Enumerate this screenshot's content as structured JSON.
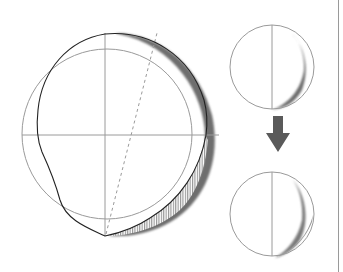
{
  "diagram": {
    "title": "",
    "colors": {
      "outline": "#9a9a9a",
      "profile": "#222222",
      "shadow": "#6e6e6e",
      "hatch": "#8a8a8a",
      "arrow": "#5a5a5a",
      "background": "#ffffff"
    },
    "main_figure": {
      "shape": "reference-circle-with-deformed-profile",
      "axes": [
        "vertical-axis",
        "horizontal-axis"
      ],
      "dashed_line": "tilted-axis",
      "regions": [
        "shadow-crescent",
        "hatched-crescent"
      ]
    },
    "side_panel": {
      "before": "circle-with-thin-shadow",
      "arrow": "down-arrow",
      "after": "circle-with-lower-shadow"
    }
  }
}
